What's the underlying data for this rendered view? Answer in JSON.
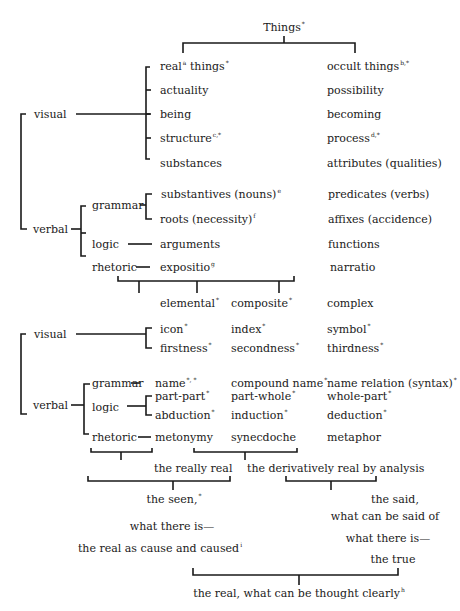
{
  "root": {
    "label": "Things",
    "sup": "*"
  },
  "top_columns": {
    "left": {
      "label": "real",
      "sup1": "a",
      "label2": " things",
      "sup2": "*"
    },
    "right": {
      "label": "occult things",
      "sup": "b,*"
    }
  },
  "section1": {
    "visual_label": "visual",
    "verbal_label": "verbal",
    "visual_rows": [
      {
        "left": "actuality",
        "right": "possibility"
      },
      {
        "left": "being",
        "right": "becoming"
      },
      {
        "left": "structure",
        "left_sup": "c,*",
        "right": "process",
        "right_sup": "d,*"
      },
      {
        "left": "substances",
        "right": "attributes (qualities)"
      }
    ],
    "verbal": {
      "grammar_label": "grammar",
      "logic_label": "logic",
      "rhetoric_label": "rhetoric",
      "grammar_rows": [
        {
          "left": "substantives (nouns)",
          "left_sup": "e",
          "right": "predicates (verbs)"
        },
        {
          "left": "roots (necessity)",
          "left_sup": "f",
          "right": "affixes (accidence)"
        }
      ],
      "logic_row": {
        "left": "arguments",
        "right": "functions"
      },
      "rhetoric_row": {
        "left": "expositio",
        "left_sup": "g",
        "right": "narratio"
      }
    }
  },
  "section2": {
    "headers": [
      {
        "label": "elemental",
        "sup": "*"
      },
      {
        "label": "composite",
        "sup": "*"
      },
      {
        "label": "complex",
        "sup": ""
      }
    ],
    "visual_label": "visual",
    "verbal_label": "verbal",
    "visual_rows": [
      [
        "icon",
        "index",
        "symbol"
      ],
      [
        "firstness",
        "secondness",
        "thirdness"
      ]
    ],
    "visual_sup": "*",
    "grammar_label": "grammar",
    "grammar_row": [
      "name",
      "compound name",
      "name relation (syntax)"
    ],
    "grammar_sups": [
      "*, *",
      "*",
      "*"
    ],
    "logic_label": "logic",
    "logic_rows": [
      [
        "part-part",
        "part-whole",
        "whole-part"
      ],
      [
        "abduction",
        "induction",
        "deduction"
      ]
    ],
    "logic_sup": "*",
    "rhetoric_label": "rhetoric",
    "rhetoric_row": [
      "metonymy",
      "synecdoche",
      "metaphor"
    ]
  },
  "synthesis": {
    "really_real": "the really real",
    "derivatively_real": "the derivatively real by analysis",
    "seen_lines": [
      "the seen,",
      "what there is—",
      "the real as cause and caused"
    ],
    "seen_sup": "*",
    "seen_end_sup": "i",
    "said_lines": [
      "the said,",
      "what can be said of",
      "what there is—",
      "the true"
    ],
    "final": "the real, what can be thought clearly",
    "final_sup": "h"
  }
}
